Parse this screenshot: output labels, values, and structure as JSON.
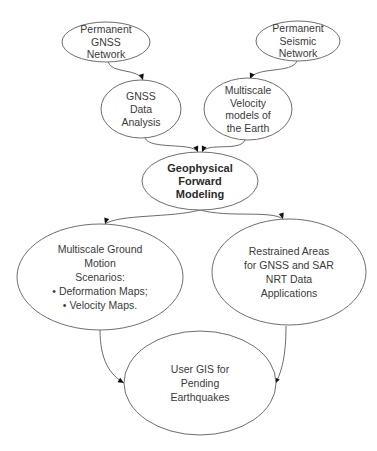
{
  "diagram": {
    "type": "flowchart",
    "nodes": [
      {
        "id": "perm_gnss",
        "lines": [
          "Permanent",
          "GNSS",
          "Network"
        ],
        "bold": false
      },
      {
        "id": "perm_seismic",
        "lines": [
          "Permanent",
          "Seismic",
          "Network"
        ],
        "bold": false
      },
      {
        "id": "gnss_analysis",
        "lines": [
          "GNSS",
          "Data",
          "Analysis"
        ],
        "bold": false
      },
      {
        "id": "velocity_models",
        "lines": [
          "Multiscale",
          "Velocity",
          "models of",
          "the Earth"
        ],
        "bold": false
      },
      {
        "id": "geophysical",
        "lines": [
          "Geophysical",
          "Forward",
          "Modeling"
        ],
        "bold": true
      },
      {
        "id": "ground_motion",
        "lines": [
          "Multiscale Ground",
          "Motion",
          "Scenarios:",
          "• Deformation Maps;",
          "• Velocity Maps."
        ],
        "bold": false
      },
      {
        "id": "restrained",
        "lines": [
          "Restrained Areas",
          "for GNSS and SAR",
          "NRT Data",
          "Applications"
        ],
        "bold": false
      },
      {
        "id": "user_gis",
        "lines": [
          "User GIS for",
          "Pending",
          "Earthquakes"
        ],
        "bold": false
      }
    ],
    "edges": [
      {
        "from": "perm_gnss",
        "to": "gnss_analysis"
      },
      {
        "from": "perm_seismic",
        "to": "velocity_models"
      },
      {
        "from": "gnss_analysis",
        "to": "geophysical"
      },
      {
        "from": "velocity_models",
        "to": "geophysical"
      },
      {
        "from": "geophysical",
        "to": "ground_motion"
      },
      {
        "from": "geophysical",
        "to": "restrained"
      },
      {
        "from": "ground_motion",
        "to": "user_gis"
      },
      {
        "from": "restrained",
        "to": "user_gis"
      }
    ]
  }
}
